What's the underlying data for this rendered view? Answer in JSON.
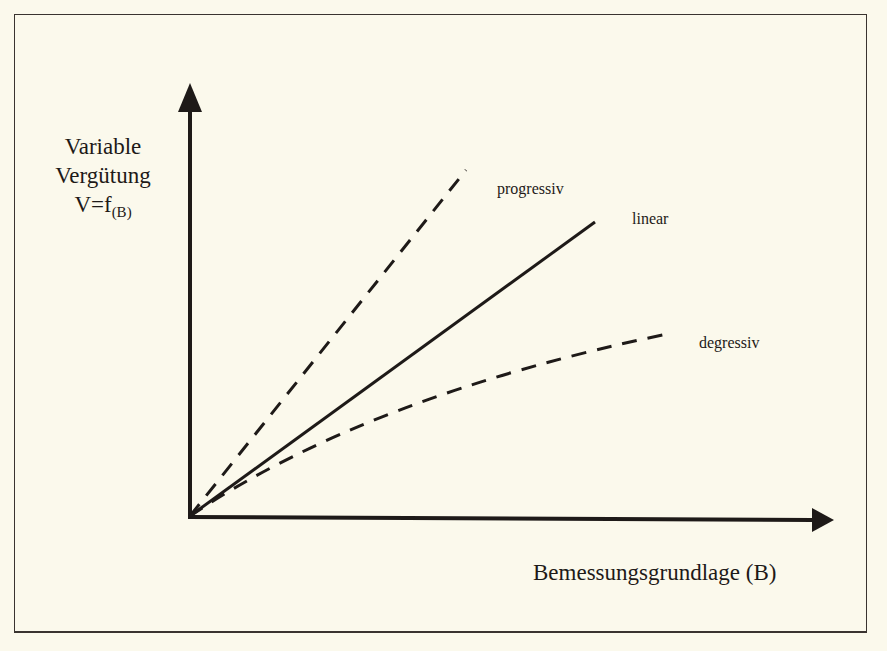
{
  "diagram": {
    "y_axis_label": {
      "line1": "Variable",
      "line2": "Vergütung",
      "formula": "V=f",
      "formula_subscript": "(B)"
    },
    "x_axis_label": "Bemessungsgrundlage (B)",
    "curves": [
      {
        "name": "progressiv",
        "style": "dashed"
      },
      {
        "name": "linear",
        "style": "solid"
      },
      {
        "name": "degressiv",
        "style": "dashed"
      }
    ],
    "colors": {
      "background": "#fbf9ec",
      "ink": "#1e1a18",
      "frame": "#3a3430"
    }
  }
}
